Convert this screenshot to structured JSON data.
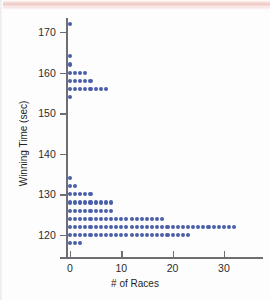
{
  "figure": {
    "background_color": "#fdfdfd",
    "dot_color": "#4a5fa8",
    "axis_color": "#6e6f73"
  },
  "chart_data": {
    "type": "scatter",
    "plot_style": "dotplot",
    "title": "",
    "xlabel": "# of Races",
    "ylabel": "Winning Time (sec)",
    "xlim": [
      -1,
      38
    ],
    "ylim": [
      116,
      174
    ],
    "grid": false,
    "legend": null,
    "x_ticks": [
      0,
      10,
      20,
      30
    ],
    "x_tick_labels": [
      "0",
      "10",
      "20",
      "30"
    ],
    "y_ticks": [
      120,
      130,
      140,
      150,
      160,
      170
    ],
    "y_tick_labels": [
      "120",
      "130",
      "140",
      "150",
      "160",
      "170"
    ],
    "rows": [
      {
        "winning_time": 172,
        "count": 1
      },
      {
        "winning_time": 164,
        "count": 1
      },
      {
        "winning_time": 162,
        "count": 1
      },
      {
        "winning_time": 160,
        "count": 4
      },
      {
        "winning_time": 158,
        "count": 5
      },
      {
        "winning_time": 156,
        "count": 8
      },
      {
        "winning_time": 154,
        "count": 1
      },
      {
        "winning_time": 134,
        "count": 1
      },
      {
        "winning_time": 132,
        "count": 2
      },
      {
        "winning_time": 130,
        "count": 5
      },
      {
        "winning_time": 128,
        "count": 9
      },
      {
        "winning_time": 126,
        "count": 9
      },
      {
        "winning_time": 124,
        "count": 19
      },
      {
        "winning_time": 122,
        "count": 33
      },
      {
        "winning_time": 120,
        "count": 24
      },
      {
        "winning_time": 118,
        "count": 3
      }
    ],
    "points": [
      {
        "x": 0,
        "y": 172
      },
      {
        "x": 0,
        "y": 164
      },
      {
        "x": 0,
        "y": 162
      },
      {
        "x": 0,
        "y": 160
      },
      {
        "x": 1,
        "y": 160
      },
      {
        "x": 2,
        "y": 160
      },
      {
        "x": 3,
        "y": 160
      },
      {
        "x": 0,
        "y": 158
      },
      {
        "x": 1,
        "y": 158
      },
      {
        "x": 2,
        "y": 158
      },
      {
        "x": 3,
        "y": 158
      },
      {
        "x": 4,
        "y": 158
      },
      {
        "x": 0,
        "y": 156
      },
      {
        "x": 1,
        "y": 156
      },
      {
        "x": 2,
        "y": 156
      },
      {
        "x": 3,
        "y": 156
      },
      {
        "x": 4,
        "y": 156
      },
      {
        "x": 5,
        "y": 156
      },
      {
        "x": 6,
        "y": 156
      },
      {
        "x": 7,
        "y": 156
      },
      {
        "x": 0,
        "y": 154
      },
      {
        "x": 0,
        "y": 134
      },
      {
        "x": 0,
        "y": 132
      },
      {
        "x": 1,
        "y": 132
      },
      {
        "x": 0,
        "y": 130
      },
      {
        "x": 1,
        "y": 130
      },
      {
        "x": 2,
        "y": 130
      },
      {
        "x": 3,
        "y": 130
      },
      {
        "x": 4,
        "y": 130
      },
      {
        "x": 0,
        "y": 128
      },
      {
        "x": 1,
        "y": 128
      },
      {
        "x": 2,
        "y": 128
      },
      {
        "x": 3,
        "y": 128
      },
      {
        "x": 4,
        "y": 128
      },
      {
        "x": 5,
        "y": 128
      },
      {
        "x": 6,
        "y": 128
      },
      {
        "x": 7,
        "y": 128
      },
      {
        "x": 8,
        "y": 128
      },
      {
        "x": 0,
        "y": 126
      },
      {
        "x": 1,
        "y": 126
      },
      {
        "x": 2,
        "y": 126
      },
      {
        "x": 3,
        "y": 126
      },
      {
        "x": 4,
        "y": 126
      },
      {
        "x": 5,
        "y": 126
      },
      {
        "x": 6,
        "y": 126
      },
      {
        "x": 7,
        "y": 126
      },
      {
        "x": 8,
        "y": 126
      },
      {
        "x": 0,
        "y": 124
      },
      {
        "x": 1,
        "y": 124
      },
      {
        "x": 2,
        "y": 124
      },
      {
        "x": 3,
        "y": 124
      },
      {
        "x": 4,
        "y": 124
      },
      {
        "x": 5,
        "y": 124
      },
      {
        "x": 6,
        "y": 124
      },
      {
        "x": 7,
        "y": 124
      },
      {
        "x": 8,
        "y": 124
      },
      {
        "x": 9,
        "y": 124
      },
      {
        "x": 10,
        "y": 124
      },
      {
        "x": 11,
        "y": 124
      },
      {
        "x": 12,
        "y": 124
      },
      {
        "x": 13,
        "y": 124
      },
      {
        "x": 14,
        "y": 124
      },
      {
        "x": 15,
        "y": 124
      },
      {
        "x": 16,
        "y": 124
      },
      {
        "x": 17,
        "y": 124
      },
      {
        "x": 18,
        "y": 124
      },
      {
        "x": 0,
        "y": 122
      },
      {
        "x": 1,
        "y": 122
      },
      {
        "x": 2,
        "y": 122
      },
      {
        "x": 3,
        "y": 122
      },
      {
        "x": 4,
        "y": 122
      },
      {
        "x": 5,
        "y": 122
      },
      {
        "x": 6,
        "y": 122
      },
      {
        "x": 7,
        "y": 122
      },
      {
        "x": 8,
        "y": 122
      },
      {
        "x": 9,
        "y": 122
      },
      {
        "x": 10,
        "y": 122
      },
      {
        "x": 11,
        "y": 122
      },
      {
        "x": 12,
        "y": 122
      },
      {
        "x": 13,
        "y": 122
      },
      {
        "x": 14,
        "y": 122
      },
      {
        "x": 15,
        "y": 122
      },
      {
        "x": 16,
        "y": 122
      },
      {
        "x": 17,
        "y": 122
      },
      {
        "x": 18,
        "y": 122
      },
      {
        "x": 19,
        "y": 122
      },
      {
        "x": 20,
        "y": 122
      },
      {
        "x": 21,
        "y": 122
      },
      {
        "x": 22,
        "y": 122
      },
      {
        "x": 23,
        "y": 122
      },
      {
        "x": 24,
        "y": 122
      },
      {
        "x": 25,
        "y": 122
      },
      {
        "x": 26,
        "y": 122
      },
      {
        "x": 27,
        "y": 122
      },
      {
        "x": 28,
        "y": 122
      },
      {
        "x": 29,
        "y": 122
      },
      {
        "x": 30,
        "y": 122
      },
      {
        "x": 31,
        "y": 122
      },
      {
        "x": 32,
        "y": 122
      },
      {
        "x": 0,
        "y": 120
      },
      {
        "x": 1,
        "y": 120
      },
      {
        "x": 2,
        "y": 120
      },
      {
        "x": 3,
        "y": 120
      },
      {
        "x": 4,
        "y": 120
      },
      {
        "x": 5,
        "y": 120
      },
      {
        "x": 6,
        "y": 120
      },
      {
        "x": 7,
        "y": 120
      },
      {
        "x": 8,
        "y": 120
      },
      {
        "x": 9,
        "y": 120
      },
      {
        "x": 10,
        "y": 120
      },
      {
        "x": 11,
        "y": 120
      },
      {
        "x": 12,
        "y": 120
      },
      {
        "x": 13,
        "y": 120
      },
      {
        "x": 14,
        "y": 120
      },
      {
        "x": 15,
        "y": 120
      },
      {
        "x": 16,
        "y": 120
      },
      {
        "x": 17,
        "y": 120
      },
      {
        "x": 18,
        "y": 120
      },
      {
        "x": 19,
        "y": 120
      },
      {
        "x": 20,
        "y": 120
      },
      {
        "x": 21,
        "y": 120
      },
      {
        "x": 22,
        "y": 120
      },
      {
        "x": 23,
        "y": 120
      },
      {
        "x": 0,
        "y": 118
      },
      {
        "x": 1,
        "y": 118
      },
      {
        "x": 2,
        "y": 118
      }
    ]
  }
}
